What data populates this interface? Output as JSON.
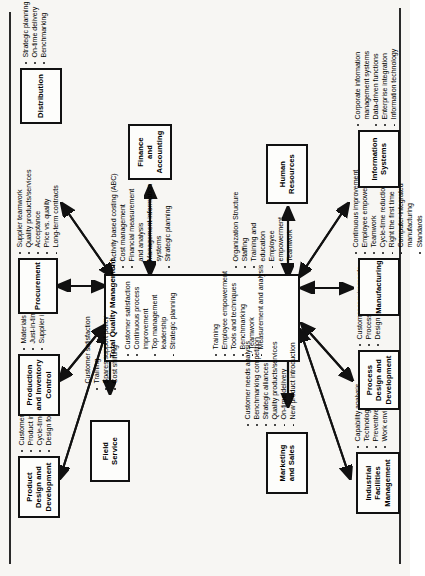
{
  "diagram": {
    "orientation": "rotated-90-ccw",
    "accent_color": "#111111",
    "page_background": "#f7f6f3"
  },
  "center": {
    "title": "Total Quality Management",
    "column_left": [
      "Customer satisfaction",
      "Continuous process",
      "improvement",
      "Top management",
      "leadership",
      "Strategic planning"
    ],
    "column_left_bullets": [
      true,
      true,
      false,
      true,
      false,
      true
    ],
    "column_right": [
      "Training",
      "Employee empowerment",
      "Tools and techniques",
      "Benchmarking",
      "Teamwork",
      "Measurement and analysis"
    ],
    "column_right_bullets": [
      true,
      true,
      true,
      true,
      true,
      true
    ]
  },
  "nodes": [
    {
      "id": "product-design",
      "label": "Product\nDesign and\nDevelopment",
      "label_lines": [
        "Product",
        "Design and",
        "Development"
      ],
      "bullets": [
        "Customer requirements",
        "Product improvement",
        "Cycle-time reduction",
        "Design for service"
      ],
      "bullet_flags": [
        true,
        true,
        true,
        true
      ]
    },
    {
      "id": "production-inventory",
      "label_lines": [
        "Production",
        "and Inventory",
        "Control"
      ],
      "bullets": [
        "Materials review board",
        "Just-in-time",
        "Supplier integration"
      ],
      "bullet_flags": [
        true,
        true,
        true
      ]
    },
    {
      "id": "procurement",
      "label_lines": [
        "Procurement"
      ],
      "bullets": [
        "Supplier teamwork",
        "Quality products/services",
        "Acceptance",
        "Price vs. quality",
        "Long-term contracts"
      ],
      "bullet_flags": [
        true,
        true,
        true,
        true,
        true
      ]
    },
    {
      "id": "distribution",
      "label_lines": [
        "Distribution"
      ],
      "bullets": [
        "Strategic planning",
        "On-time delivery",
        "Benchmarking"
      ],
      "bullet_flags": [
        true,
        true,
        true
      ]
    },
    {
      "id": "field-service",
      "label_lines": [
        "Field",
        "Service"
      ],
      "bullets": [
        "Customer satisfaction",
        "Training",
        "Spares support policy",
        "Cost shifting"
      ],
      "bullet_flags": [
        true,
        true,
        true,
        true
      ]
    },
    {
      "id": "finance-accounting",
      "label_lines": [
        "Finance",
        "and",
        "Accounting"
      ],
      "bullets": [
        "Activity based costing  (ABC)",
        "Cost management",
        "Financial measurement",
        "and analysis",
        "Management information",
        "systems",
        "Strategic planning"
      ],
      "bullet_flags": [
        true,
        true,
        true,
        false,
        true,
        false,
        true
      ]
    },
    {
      "id": "marketing-sales",
      "label_lines": [
        "Marketing",
        "and Sales"
      ],
      "bullets": [
        "Customer needs analysis",
        "Benchmarking competition",
        "Strategic alliances",
        "Quality products/services",
        "On-time delivery",
        "New product introduction"
      ],
      "bullet_flags": [
        true,
        true,
        true,
        true,
        true,
        true
      ]
    },
    {
      "id": "human-resources",
      "label_lines": [
        "Human",
        "Resources"
      ],
      "bullets": [
        "Organization Structure",
        "Staffing",
        "Training and",
        "education",
        "Employee",
        "empowerment",
        "Teamwork"
      ],
      "bullet_flags": [
        true,
        true,
        true,
        false,
        true,
        false,
        true
      ]
    },
    {
      "id": "industrial-facilities",
      "label_lines": [
        "Industrial",
        "Facilities",
        "Management"
      ],
      "bullets": [
        "Capability analysis",
        "Technology adoption",
        "Preventive maintenance",
        "Work environment and safety"
      ],
      "bullet_flags": [
        true,
        true,
        true,
        true
      ]
    },
    {
      "id": "process-design",
      "label_lines": [
        "Process",
        "Design and",
        "Development"
      ],
      "bullets": [
        "Customer requirements",
        "Process improvement",
        "Design for manufacturing"
      ],
      "bullet_flags": [
        true,
        true,
        true
      ]
    },
    {
      "id": "manufacturing",
      "label_lines": [
        "Manufacturing"
      ],
      "bullets": [
        "Continuous improvement",
        "Employee empowerment",
        "Teamwork",
        "Cycle-time reduction",
        "Right the first time",
        "Computer-integrated",
        "manufacturing",
        "Standards"
      ],
      "bullet_flags": [
        true,
        true,
        true,
        true,
        true,
        true,
        false,
        true
      ]
    },
    {
      "id": "information-systems",
      "label_lines": [
        "Information",
        "Systems"
      ],
      "bullets": [
        "Corporate information",
        "management systems",
        "Data-driven functions",
        "Enterprise integration",
        "Information technology"
      ],
      "bullet_flags": [
        true,
        false,
        true,
        true,
        true
      ]
    }
  ]
}
